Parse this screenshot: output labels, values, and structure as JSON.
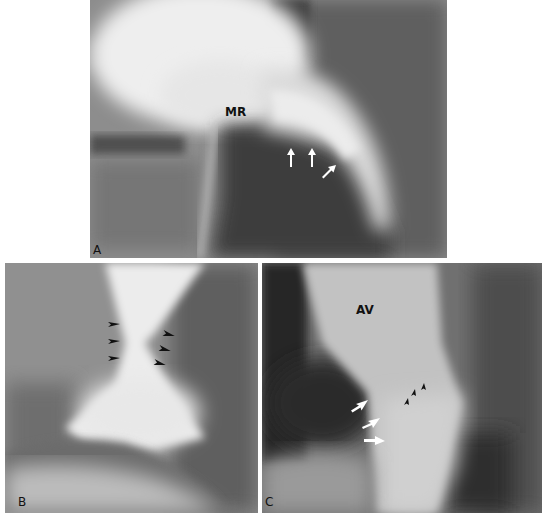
{
  "figure": {
    "panels": [
      {
        "id": "A",
        "label": "A",
        "annotations": [
          {
            "text": "MR",
            "type": "text-label"
          },
          {
            "type": "white-arrow",
            "count": 3
          }
        ]
      },
      {
        "id": "B",
        "label": "B",
        "annotations": [
          {
            "type": "black-arrowhead",
            "count": 6
          }
        ]
      },
      {
        "id": "C",
        "label": "C",
        "annotations": [
          {
            "text": "AV",
            "type": "text-label"
          },
          {
            "type": "white-arrow",
            "count": 3
          },
          {
            "type": "black-arrowhead",
            "count": 3
          }
        ]
      }
    ]
  }
}
